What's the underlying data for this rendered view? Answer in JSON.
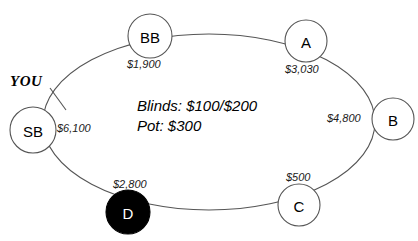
{
  "diagram": {
    "table": {
      "shape": "ellipse",
      "stroke_color": "#555555",
      "fill_color": "#ffffff"
    },
    "hero_marker": {
      "label": "YOU",
      "points_to": "SB"
    },
    "center": {
      "blinds_line": "Blinds: $100/$200",
      "pot_line": "Pot: $300"
    },
    "seats": [
      {
        "id": "seat-bb",
        "label": "BB",
        "stack": "$1,900",
        "is_dealer": false,
        "is_hero": false
      },
      {
        "id": "seat-a",
        "label": "A",
        "stack": "$3,030",
        "is_dealer": false,
        "is_hero": false
      },
      {
        "id": "seat-b",
        "label": "B",
        "stack": "$4,800",
        "is_dealer": false,
        "is_hero": false
      },
      {
        "id": "seat-c",
        "label": "C",
        "stack": "$500",
        "is_dealer": false,
        "is_hero": false
      },
      {
        "id": "seat-d",
        "label": "D",
        "stack": "$2,800",
        "is_dealer": true,
        "is_hero": false
      },
      {
        "id": "seat-sb",
        "label": "SB",
        "stack": "$6,100",
        "is_dealer": false,
        "is_hero": true
      }
    ],
    "colors": {
      "dealer_fill": "#000000",
      "dealer_text": "#ffffff",
      "seat_fill": "#ffffff",
      "seat_stroke": "#555555",
      "text": "#000000"
    }
  }
}
